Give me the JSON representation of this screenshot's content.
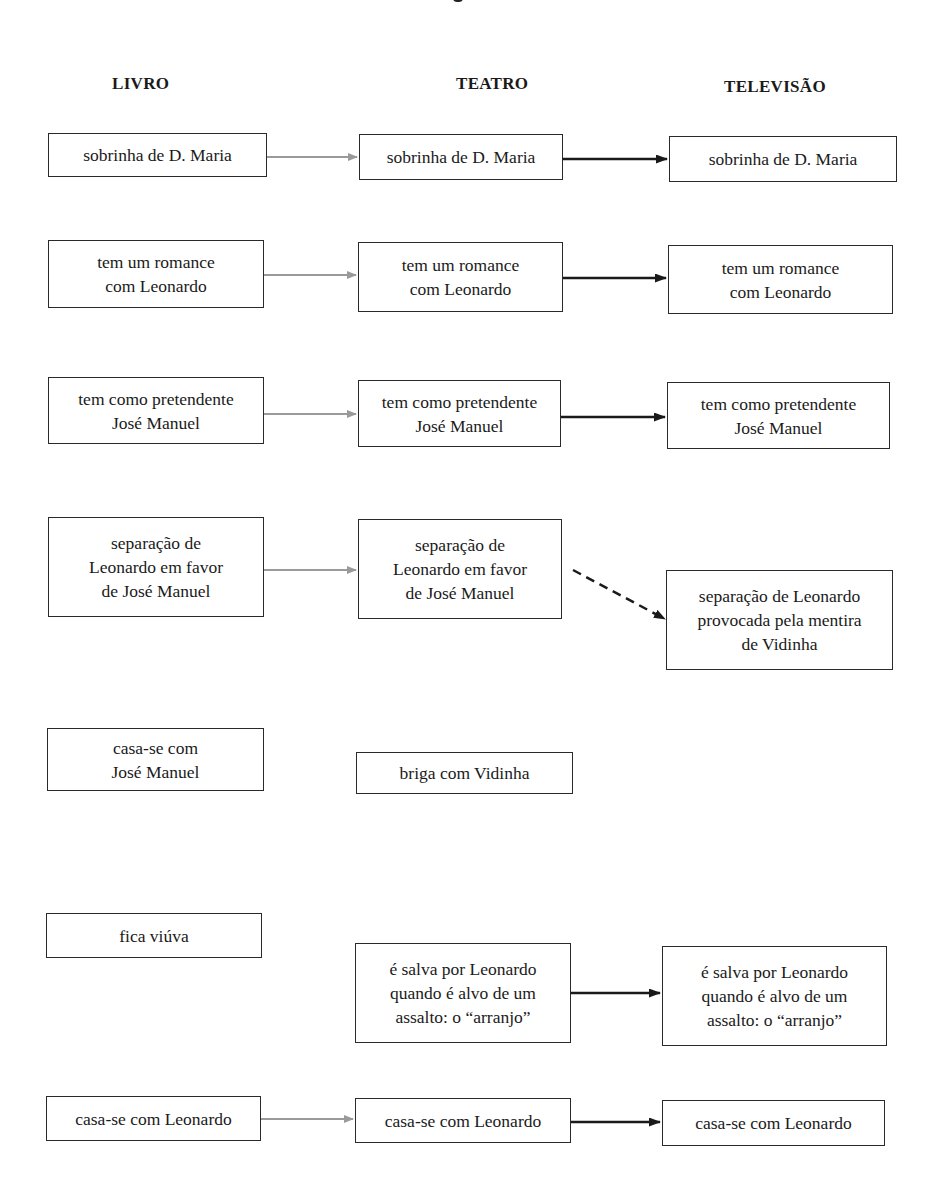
{
  "columns": [
    {
      "label": "LIVRO"
    },
    {
      "label": "TEATRO"
    },
    {
      "label": "TELEVISÃO"
    }
  ],
  "rows": [
    {
      "livro": "sobrinha de D. Maria",
      "teatro": "sobrinha de D. Maria",
      "televisao": "sobrinha de D. Maria"
    },
    {
      "livro": "tem um romance\ncom Leonardo",
      "teatro": "tem um romance\ncom Leonardo",
      "televisao": "tem um romance\ncom Leonardo"
    },
    {
      "livro": "tem como pretendente\nJosé Manuel",
      "teatro": "tem como pretendente\nJosé Manuel",
      "televisao": "tem como pretendente\nJosé Manuel"
    },
    {
      "livro": "separação de\nLeonardo em  favor\nde José Manuel",
      "teatro": "separação de\nLeonardo em  favor\nde José Manuel",
      "televisao": "separação de Leonardo\nprovocada pela mentira\nde Vidinha"
    },
    {
      "livro": "casa-se com\nJosé Manuel",
      "teatro": "briga com Vidinha",
      "televisao": null
    },
    {
      "livro": "fica viúva",
      "teatro": "é salva por Leonardo\nquando é alvo de um\nassalto: o “arranjo”",
      "televisao": "é salva por Leonardo\nquando é alvo de um\nassalto: o “arranjo”"
    },
    {
      "livro": "casa-se com Leonardo",
      "teatro": "casa-se com Leonardo",
      "televisao": "casa-se com Leonardo"
    }
  ],
  "arrows": {
    "livro_to_teatro_color": "#9a9a9a",
    "teatro_to_televisao_color": "#1a1a1a",
    "dashed_color": "#1a1a1a"
  }
}
